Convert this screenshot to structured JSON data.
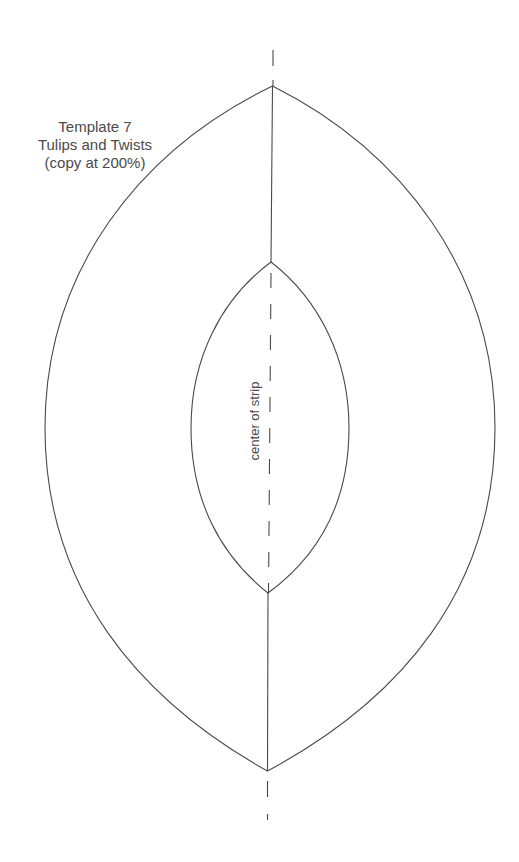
{
  "template": {
    "title_lines": [
      "Template 7",
      "Tulips and Twists",
      "(copy at 200%)"
    ],
    "center_label": "center of strip"
  },
  "colors": {
    "line": "#4a4a4a",
    "background": "#ffffff"
  }
}
